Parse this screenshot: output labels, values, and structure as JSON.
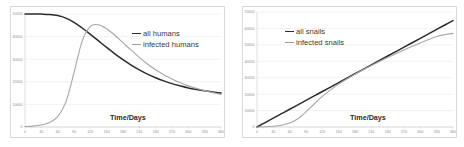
{
  "page": {
    "background": "#ffffff",
    "dark_series_color": "#2b2b2b",
    "gray_series_color": "#a6a6a6",
    "grid_color": "#e3e3e3",
    "tick_label_color": "#8d8d8d"
  },
  "left": {
    "axis_title": "Time/Days",
    "legend": [
      {
        "label": "all humans",
        "style": "dark"
      },
      {
        "label": "infected humans",
        "style": "gray"
      }
    ],
    "y_ticks": [
      "0",
      "10000",
      "20000",
      "30000",
      "40000",
      "50000"
    ],
    "x_ticks": [
      "0",
      "30",
      "60",
      "90",
      "120",
      "150",
      "180",
      "210",
      "240",
      "270",
      "300",
      "330",
      "360"
    ]
  },
  "right": {
    "axis_title": "Time/Days",
    "legend": [
      {
        "label": "all snails",
        "style": "dark"
      },
      {
        "label": "infected snails",
        "style": "gray"
      }
    ],
    "y_ticks": [
      "0",
      "10000",
      "20000",
      "30000",
      "40000",
      "50000",
      "60000",
      "70000"
    ],
    "x_ticks": [
      "0",
      "30",
      "60",
      "90",
      "120",
      "150",
      "180",
      "210",
      "240",
      "270",
      "300",
      "330",
      "360"
    ]
  },
  "chart_data": [
    {
      "type": "line",
      "title": "",
      "xlabel": "Time/Days",
      "ylabel": "",
      "xlim": [
        0,
        360
      ],
      "ylim": [
        0,
        50000
      ],
      "grid": true,
      "legend_position": "upper-right",
      "x": [
        0,
        15,
        30,
        45,
        60,
        75,
        90,
        105,
        120,
        135,
        150,
        165,
        180,
        195,
        210,
        225,
        240,
        255,
        270,
        285,
        300,
        315,
        330,
        345,
        360
      ],
      "series": [
        {
          "name": "all humans",
          "color": "#2b2b2b",
          "values": [
            50000,
            50000,
            49950,
            49800,
            49300,
            48200,
            46300,
            43800,
            41000,
            38100,
            35200,
            32400,
            29800,
            27400,
            25300,
            23400,
            21800,
            20400,
            19200,
            18200,
            17300,
            16600,
            16000,
            15500,
            15000
          ]
        },
        {
          "name": "infected humans",
          "color": "#a6a6a6",
          "values": [
            200,
            400,
            900,
            2000,
            4600,
            11000,
            24000,
            38000,
            44500,
            45200,
            43500,
            40600,
            37300,
            34000,
            30800,
            27900,
            25300,
            23100,
            21200,
            19600,
            18200,
            17100,
            16100,
            15200,
            14400
          ]
        }
      ]
    },
    {
      "type": "line",
      "title": "",
      "xlabel": "Time/Days",
      "ylabel": "",
      "xlim": [
        0,
        360
      ],
      "ylim": [
        0,
        70000
      ],
      "grid": true,
      "legend_position": "upper-left",
      "x": [
        0,
        15,
        30,
        45,
        60,
        75,
        90,
        105,
        120,
        135,
        150,
        165,
        180,
        195,
        210,
        225,
        240,
        255,
        270,
        285,
        300,
        315,
        330,
        345,
        360
      ],
      "series": [
        {
          "name": "all snails",
          "color": "#2b2b2b",
          "values": [
            0,
            2700,
            5400,
            8100,
            10800,
            13500,
            16200,
            18900,
            21600,
            24300,
            27000,
            29700,
            32400,
            35100,
            37800,
            40500,
            43200,
            45900,
            48600,
            51300,
            54000,
            56700,
            59400,
            62100,
            64800
          ]
        },
        {
          "name": "infected snails",
          "color": "#a6a6a6",
          "values": [
            0,
            150,
            450,
            1100,
            2400,
            5000,
            9200,
            14000,
            18600,
            22600,
            26100,
            29200,
            32100,
            34800,
            37400,
            39900,
            42300,
            44600,
            46900,
            49100,
            51200,
            53200,
            55100,
            56200,
            57000
          ]
        }
      ]
    }
  ]
}
